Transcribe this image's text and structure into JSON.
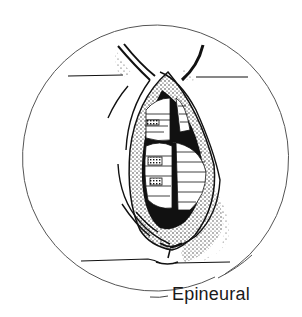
{
  "figure": {
    "label": "Epineural",
    "colors": {
      "ink": "#111111",
      "circle": "#555555",
      "background": "#ffffff"
    }
  }
}
